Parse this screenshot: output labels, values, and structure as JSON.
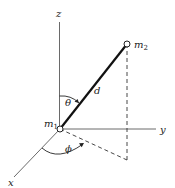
{
  "diagram": {
    "axes": {
      "x_label": "x",
      "y_label": "y",
      "z_label": "z"
    },
    "masses": [
      {
        "label": "m",
        "subscript": "1"
      },
      {
        "label": "m",
        "subscript": "2"
      }
    ],
    "separation_label": "d",
    "angles": {
      "polar": "θ",
      "azimuthal": "ϕ"
    }
  }
}
